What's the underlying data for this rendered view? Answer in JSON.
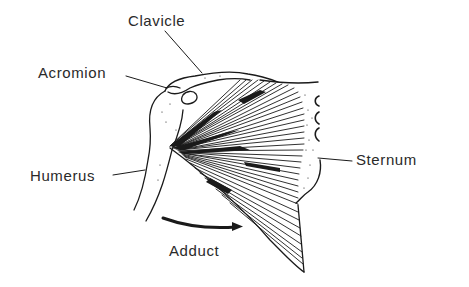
{
  "figure": {
    "ink_color": "#1a1a1a",
    "text_color": "#2a2a2a",
    "background": "#ffffff"
  },
  "labels": {
    "clavicle": "Clavicle",
    "acromion": "Acromion",
    "humerus": "Humerus",
    "sternum": "Sternum",
    "adduct": "Adduct"
  },
  "arrow": {
    "direction": "right",
    "meaning": "adduct"
  }
}
